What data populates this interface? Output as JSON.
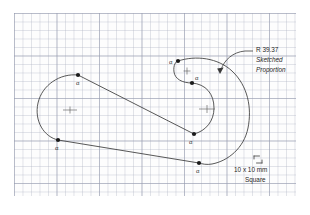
{
  "drawing": {
    "title": "Sketched hook profile on graph paper",
    "background_color": "#ffffff",
    "paper_color": "#fdfdfd",
    "grid_minor_color": "#b2b6c6",
    "grid_major_color": "#969bAF",
    "ink_color": "#3a3a3a",
    "text_color": "#262626"
  },
  "annotations": {
    "radius_note": "R 39.37",
    "sketched_label": "Sketched",
    "proportion_label": "Proportion",
    "square_size_line1": "10 x 10 mm",
    "square_size_line2": "Square"
  },
  "tangent_points": [
    {
      "id": "tp-upper-left",
      "label": "α",
      "x": 78,
      "y": 75,
      "lx": 76,
      "ly": 82
    },
    {
      "id": "tp-lower-left",
      "label": "α",
      "x": 58,
      "y": 140,
      "lx": 56,
      "ly": 150
    },
    {
      "id": "tp-mid-right",
      "label": "α",
      "x": 194,
      "y": 134,
      "lx": 189,
      "ly": 144
    },
    {
      "id": "tp-bottom",
      "label": "α",
      "x": 199,
      "y": 163,
      "lx": 195,
      "ly": 172
    },
    {
      "id": "tp-curl-upper",
      "label": "α",
      "x": 178,
      "y": 61,
      "lx": 170,
      "ly": 65
    },
    {
      "id": "tp-curl-lower",
      "label": "α",
      "x": 192,
      "y": 83,
      "lx": 194,
      "ly": 79
    }
  ],
  "center_marks": [
    {
      "id": "center-left",
      "x": 70,
      "y": 110
    },
    {
      "id": "center-right",
      "x": 207,
      "y": 109
    },
    {
      "id": "center-curl",
      "x": 187,
      "y": 71
    }
  ]
}
